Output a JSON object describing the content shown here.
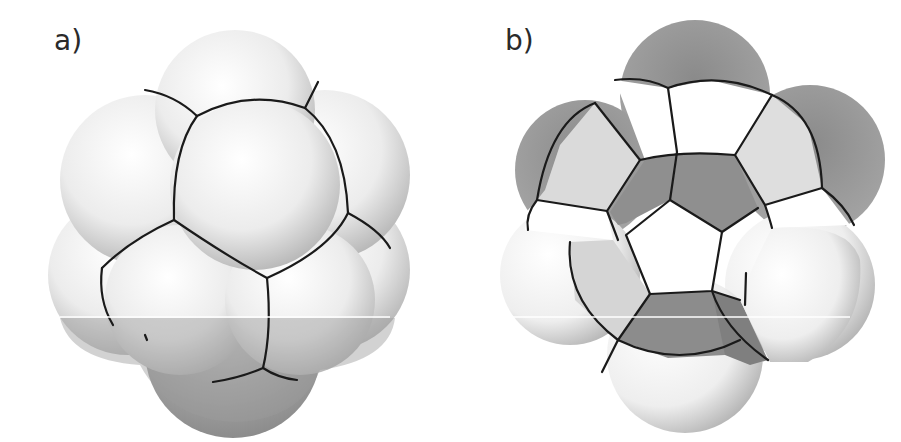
{
  "figure": {
    "panels": [
      {
        "id": "a",
        "label": "a)",
        "description": "Cluster of packed spheres with cell boundaries drawn as dark curves (front view, intact)"
      },
      {
        "id": "b",
        "label": "b)",
        "description": "Same cluster cut open revealing a central pentagonal cell surrounded by faceted cells"
      }
    ],
    "colors": {
      "background": "#ffffff",
      "sphere_light": "#f7f7f7",
      "sphere_shade": "#9a9a9a",
      "facet_mid": "#d9d9d9",
      "facet_dark": "#8e8e8e",
      "edge": "#1a1a1a"
    }
  }
}
